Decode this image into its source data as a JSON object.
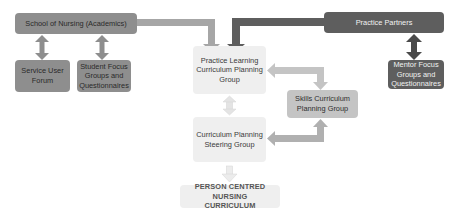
{
  "diagram": {
    "nodes": {
      "school": "School of Nursing (Academics)",
      "service_user": "Service User Forum",
      "student_focus": "Student Focus Groups and Questionnaires",
      "practice_partners": "Practice Partners",
      "mentor_focus": "Mentor Focus Groups and Questionnaires",
      "practice_learning": "Practice Learning Curriculum Planning Group",
      "skills": "Skills Curriculum Planning Group",
      "steering": "Curriculum Planning Steering Group",
      "final": "PERSON CENTRED NURSING CURRICULUM"
    },
    "colors": {
      "mid_gray": "#8e8e8e",
      "dark_gray": "#5e5e5e",
      "light_gray": "#efefef",
      "light_mid_gray": "#c4c4c4"
    }
  }
}
